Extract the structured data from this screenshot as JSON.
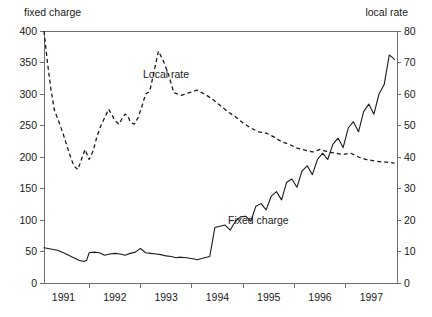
{
  "chart_data": {
    "type": "line",
    "title": "",
    "subtitle": "",
    "left_axis": {
      "label": "fixed charge",
      "ticks": [
        0,
        50,
        100,
        150,
        200,
        250,
        300,
        350,
        400
      ],
      "ylim": [
        0,
        400
      ],
      "tick_labels": [
        "0",
        "50",
        "100",
        "150",
        "200",
        "250",
        "300",
        "350",
        "400"
      ]
    },
    "right_axis": {
      "label": "local rate",
      "ticks": [
        0,
        10,
        20,
        30,
        40,
        50,
        60,
        70,
        80
      ],
      "ylim": [
        0,
        80
      ],
      "tick_labels": [
        "0",
        "10",
        "20",
        "30",
        "40",
        "50",
        "60",
        "70",
        "80"
      ]
    },
    "xlabel": "",
    "xlim": [
      1990.62,
      1997.5
    ],
    "x_tick_labels": [
      "1991",
      "1992",
      "1993",
      "1994",
      "1995",
      "1996",
      "1997"
    ],
    "x_ticks": [
      1991,
      1992,
      1993,
      1994,
      1995,
      1996,
      1997
    ],
    "grid": false,
    "legend": "inline-annotations",
    "annotations": [
      {
        "text": "Local rate",
        "x": 1992.05,
        "y_left": 325
      },
      {
        "text": "Fixed charge",
        "x": 1993.95,
        "y_left": 112
      }
    ],
    "series": [
      {
        "name": "Fixed charge",
        "axis": "left",
        "style": "solid",
        "color": "#1a1a1a",
        "x": [
          1990.62,
          1990.75,
          1990.88,
          1991.0,
          1991.1,
          1991.2,
          1991.3,
          1991.4,
          1991.45,
          1991.5,
          1991.6,
          1991.7,
          1991.8,
          1991.9,
          1992.0,
          1992.1,
          1992.2,
          1992.3,
          1992.4,
          1992.5,
          1992.6,
          1992.7,
          1992.8,
          1992.9,
          1993.0,
          1993.1,
          1993.2,
          1993.25,
          1993.4,
          1993.55,
          1993.6,
          1993.75,
          1993.85,
          1993.95,
          1994.05,
          1994.15,
          1994.25,
          1994.35,
          1994.45,
          1994.55,
          1994.65,
          1994.75,
          1994.85,
          1994.95,
          1995.05,
          1995.15,
          1995.25,
          1995.35,
          1995.45,
          1995.55,
          1995.65,
          1995.75,
          1995.85,
          1995.95,
          1996.05,
          1996.15,
          1996.25,
          1996.35,
          1996.45,
          1996.55,
          1996.65,
          1996.75,
          1996.85,
          1996.95,
          1997.05,
          1997.15,
          1997.25,
          1997.35,
          1997.45
        ],
        "y": [
          56,
          54,
          52,
          48,
          44,
          40,
          36,
          34,
          36,
          48,
          49,
          48,
          44,
          46,
          47,
          46,
          44,
          47,
          49,
          55,
          48,
          47,
          46,
          45,
          43,
          42,
          40,
          41,
          40,
          38,
          37,
          40,
          42,
          88,
          90,
          92,
          84,
          98,
          105,
          106,
          98,
          122,
          126,
          116,
          138,
          145,
          132,
          160,
          165,
          152,
          178,
          186,
          172,
          196,
          206,
          196,
          220,
          230,
          215,
          246,
          256,
          240,
          272,
          284,
          268,
          300,
          315,
          362,
          355
        ]
      },
      {
        "name": "Local rate",
        "axis": "right",
        "style": "dashed",
        "color": "#1a1a1a",
        "x": [
          1990.62,
          1990.68,
          1990.75,
          1990.82,
          1990.9,
          1990.98,
          1991.05,
          1991.12,
          1991.2,
          1991.28,
          1991.35,
          1991.42,
          1991.5,
          1991.58,
          1991.65,
          1991.72,
          1991.8,
          1991.88,
          1991.95,
          1992.0,
          1992.08,
          1992.15,
          1992.2,
          1992.25,
          1992.3,
          1992.38,
          1992.45,
          1992.52,
          1992.6,
          1992.68,
          1992.75,
          1992.85,
          1992.95,
          1993.05,
          1993.15,
          1993.3,
          1993.45,
          1993.6,
          1993.75,
          1993.9,
          1994.05,
          1994.2,
          1994.35,
          1994.5,
          1994.65,
          1994.8,
          1994.95,
          1995.1,
          1995.25,
          1995.4,
          1995.55,
          1995.7,
          1995.85,
          1996.0,
          1996.15,
          1996.3,
          1996.45,
          1996.6,
          1996.75,
          1996.9,
          1997.05,
          1997.2,
          1997.35,
          1997.45
        ],
        "y_left": [
          400,
          355,
          310,
          275,
          258,
          240,
          222,
          204,
          186,
          180,
          196,
          212,
          196,
          210,
          232,
          248,
          262,
          276,
          266,
          258,
          252,
          262,
          268,
          266,
          256,
          252,
          262,
          278,
          300,
          304,
          330,
          368,
          352,
          330,
          302,
          298,
          302,
          306,
          300,
          292,
          282,
          272,
          264,
          254,
          246,
          240,
          238,
          232,
          224,
          220,
          214,
          211,
          208,
          212,
          208,
          206,
          204,
          206,
          200,
          196,
          194,
          192,
          192,
          190
        ]
      }
    ]
  }
}
